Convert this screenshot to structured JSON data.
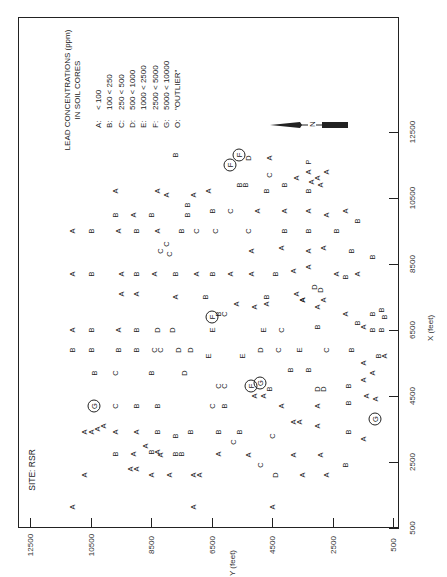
{
  "chart_data": {
    "type": "scatter",
    "site_label": "SITE: RSR",
    "xlabel": "X (feet)",
    "ylabel": "Y (feet)",
    "orientation": "page rotated 90° counter-clockwise",
    "xlim": [
      500,
      12500
    ],
    "ylim": [
      500,
      12500
    ],
    "x_ticks": [
      500,
      2500,
      4500,
      6500,
      8500,
      10500,
      12500
    ],
    "y_ticks": [
      500,
      2500,
      4500,
      6500,
      8500,
      10500,
      12500
    ],
    "grid": false,
    "legend": {
      "title_line1": "LEAD CONCENTRATIONS (ppm)",
      "title_line2": "IN SOIL CORES",
      "items": [
        {
          "code": "A:",
          "range": "< 100"
        },
        {
          "code": "B:",
          "range": "100 < 250"
        },
        {
          "code": "C:",
          "range": "250 < 500"
        },
        {
          "code": "D:",
          "range": "500 < 1000"
        },
        {
          "code": "E:",
          "range": "1000 < 2500"
        },
        {
          "code": "F:",
          "range": "2500 < 5000"
        },
        {
          "code": "G:",
          "range": "5000 < 10000"
        },
        {
          "code": "O:",
          "range": "\"OUTLIER\""
        }
      ]
    },
    "north_arrow_label": "N",
    "points": [
      {
        "x": 1150,
        "y": 11100,
        "c": "A"
      },
      {
        "x": 1150,
        "y": 7100,
        "c": "A"
      },
      {
        "x": 1150,
        "y": 4500,
        "c": "A"
      },
      {
        "x": 2100,
        "y": 10700,
        "c": "A"
      },
      {
        "x": 2100,
        "y": 8500,
        "c": "A"
      },
      {
        "x": 2100,
        "y": 7900,
        "c": "A"
      },
      {
        "x": 2100,
        "y": 7100,
        "c": "A"
      },
      {
        "x": 2100,
        "y": 6900,
        "c": "A"
      },
      {
        "x": 2100,
        "y": 4400,
        "c": "D"
      },
      {
        "x": 2100,
        "y": 3500,
        "c": "A"
      },
      {
        "x": 2100,
        "y": 2700,
        "c": "A"
      },
      {
        "x": 2300,
        "y": 9200,
        "c": "A"
      },
      {
        "x": 2300,
        "y": 9000,
        "c": "A"
      },
      {
        "x": 2400,
        "y": 4900,
        "c": "C"
      },
      {
        "x": 2400,
        "y": 2100,
        "c": "B"
      },
      {
        "x": 2750,
        "y": 9700,
        "c": "B"
      },
      {
        "x": 2750,
        "y": 9100,
        "c": "A"
      },
      {
        "x": 2700,
        "y": 8200,
        "c": "A"
      },
      {
        "x": 2800,
        "y": 8500,
        "c": "B"
      },
      {
        "x": 2800,
        "y": 8300,
        "c": "A"
      },
      {
        "x": 2750,
        "y": 7700,
        "c": "B"
      },
      {
        "x": 2750,
        "y": 7500,
        "c": "B"
      },
      {
        "x": 2750,
        "y": 6300,
        "c": "A"
      },
      {
        "x": 2700,
        "y": 5300,
        "c": "A"
      },
      {
        "x": 2700,
        "y": 3800,
        "c": "A"
      },
      {
        "x": 2700,
        "y": 2900,
        "c": "A"
      },
      {
        "x": 3000,
        "y": 8700,
        "c": "A"
      },
      {
        "x": 3100,
        "y": 5800,
        "c": "C"
      },
      {
        "x": 3300,
        "y": 4500,
        "c": "C"
      },
      {
        "x": 3400,
        "y": 10700,
        "c": "A"
      },
      {
        "x": 3400,
        "y": 10500,
        "c": "A"
      },
      {
        "x": 3500,
        "y": 10300,
        "c": "A"
      },
      {
        "x": 3600,
        "y": 10100,
        "c": "A"
      },
      {
        "x": 3400,
        "y": 9700,
        "c": "A"
      },
      {
        "x": 3400,
        "y": 9000,
        "c": "A"
      },
      {
        "x": 3400,
        "y": 8300,
        "c": "B"
      },
      {
        "x": 3300,
        "y": 7700,
        "c": "B"
      },
      {
        "x": 3400,
        "y": 7200,
        "c": "B"
      },
      {
        "x": 3400,
        "y": 6300,
        "c": "B"
      },
      {
        "x": 3400,
        "y": 5600,
        "c": "B"
      },
      {
        "x": 3700,
        "y": 3800,
        "c": "A"
      },
      {
        "x": 3700,
        "y": 3600,
        "c": "A"
      },
      {
        "x": 3600,
        "y": 3000,
        "c": "A"
      },
      {
        "x": 3400,
        "y": 2000,
        "c": "B"
      },
      {
        "x": 3200,
        "y": 1500,
        "c": "A"
      },
      {
        "x": 3800,
        "y": 1100,
        "c": "G",
        "circled": true
      },
      {
        "x": 4200,
        "y": 10400,
        "c": "G",
        "circled": true
      },
      {
        "x": 4200,
        "y": 9700,
        "c": "C"
      },
      {
        "x": 4200,
        "y": 9000,
        "c": "B"
      },
      {
        "x": 4200,
        "y": 8300,
        "c": "B"
      },
      {
        "x": 4200,
        "y": 6500,
        "c": "C"
      },
      {
        "x": 4200,
        "y": 6100,
        "c": "B"
      },
      {
        "x": 4200,
        "y": 4200,
        "c": "A"
      },
      {
        "x": 4200,
        "y": 3000,
        "c": "A"
      },
      {
        "x": 4300,
        "y": 2000,
        "c": "B"
      },
      {
        "x": 4500,
        "y": 5100,
        "c": "A"
      },
      {
        "x": 4500,
        "y": 4800,
        "c": "A"
      },
      {
        "x": 4700,
        "y": 4600,
        "c": "B"
      },
      {
        "x": 4800,
        "y": 6300,
        "c": "C"
      },
      {
        "x": 4800,
        "y": 6100,
        "c": "C"
      },
      {
        "x": 4800,
        "y": 5200,
        "c": "F",
        "circled": true
      },
      {
        "x": 4900,
        "y": 4900,
        "c": "G",
        "circled": true
      },
      {
        "x": 4700,
        "y": 3000,
        "c": "D"
      },
      {
        "x": 4700,
        "y": 2800,
        "c": "D"
      },
      {
        "x": 4800,
        "y": 2000,
        "c": "B"
      },
      {
        "x": 4500,
        "y": 1400,
        "c": "A"
      },
      {
        "x": 4400,
        "y": 1100,
        "c": "A"
      },
      {
        "x": 5200,
        "y": 10400,
        "c": "B"
      },
      {
        "x": 5200,
        "y": 9700,
        "c": "C"
      },
      {
        "x": 5200,
        "y": 8500,
        "c": "B"
      },
      {
        "x": 5200,
        "y": 7400,
        "c": "D"
      },
      {
        "x": 5300,
        "y": 3900,
        "c": "B"
      },
      {
        "x": 5300,
        "y": 3300,
        "c": "B"
      },
      {
        "x": 5000,
        "y": 1500,
        "c": "A"
      },
      {
        "x": 5200,
        "y": 1200,
        "c": "A"
      },
      {
        "x": 5900,
        "y": 11100,
        "c": "B"
      },
      {
        "x": 5900,
        "y": 10500,
        "c": "B"
      },
      {
        "x": 5900,
        "y": 9600,
        "c": "B"
      },
      {
        "x": 5900,
        "y": 9000,
        "c": "B"
      },
      {
        "x": 5900,
        "y": 8400,
        "c": "C"
      },
      {
        "x": 5900,
        "y": 8200,
        "c": "C"
      },
      {
        "x": 5900,
        "y": 7600,
        "c": "D"
      },
      {
        "x": 5900,
        "y": 7200,
        "c": "D"
      },
      {
        "x": 5700,
        "y": 6600,
        "c": "E"
      },
      {
        "x": 5700,
        "y": 5500,
        "c": "E"
      },
      {
        "x": 5900,
        "y": 4900,
        "c": "D"
      },
      {
        "x": 5900,
        "y": 4300,
        "c": "C"
      },
      {
        "x": 5900,
        "y": 3600,
        "c": "E"
      },
      {
        "x": 5900,
        "y": 2700,
        "c": "C"
      },
      {
        "x": 5900,
        "y": 1900,
        "c": "B"
      },
      {
        "x": 5500,
        "y": 1500,
        "c": "A"
      },
      {
        "x": 5700,
        "y": 1000,
        "c": "B"
      },
      {
        "x": 5700,
        "y": 800,
        "c": "A"
      },
      {
        "x": 6500,
        "y": 11100,
        "c": "A"
      },
      {
        "x": 6500,
        "y": 10500,
        "c": "B"
      },
      {
        "x": 6500,
        "y": 9600,
        "c": "A"
      },
      {
        "x": 6500,
        "y": 9000,
        "c": "B"
      },
      {
        "x": 6500,
        "y": 8300,
        "c": "D"
      },
      {
        "x": 6500,
        "y": 7800,
        "c": "D"
      },
      {
        "x": 6500,
        "y": 6500,
        "c": "E"
      },
      {
        "x": 6500,
        "y": 4800,
        "c": "E"
      },
      {
        "x": 6500,
        "y": 4200,
        "c": "C"
      },
      {
        "x": 6600,
        "y": 3000,
        "c": "B"
      },
      {
        "x": 6600,
        "y": 1500,
        "c": "A"
      },
      {
        "x": 6500,
        "y": 1200,
        "c": "B"
      },
      {
        "x": 6500,
        "y": 900,
        "c": "B"
      },
      {
        "x": 6900,
        "y": 6500,
        "c": "F",
        "circled": true
      },
      {
        "x": 7000,
        "y": 6300,
        "c": "B"
      },
      {
        "x": 7000,
        "y": 6100,
        "c": "C"
      },
      {
        "x": 7300,
        "y": 5700,
        "c": "A"
      },
      {
        "x": 7200,
        "y": 5100,
        "c": "A"
      },
      {
        "x": 7300,
        "y": 4700,
        "c": "A"
      },
      {
        "x": 7400,
        "y": 3500,
        "c": "A"
      },
      {
        "x": 7200,
        "y": 3000,
        "c": "A"
      },
      {
        "x": 7000,
        "y": 2100,
        "c": "A"
      },
      {
        "x": 6700,
        "y": 1700,
        "c": "B"
      },
      {
        "x": 6900,
        "y": 800,
        "c": "B"
      },
      {
        "x": 7000,
        "y": 1200,
        "c": "B"
      },
      {
        "x": 7100,
        "y": 900,
        "c": "B"
      },
      {
        "x": 7600,
        "y": 9500,
        "c": "A"
      },
      {
        "x": 7600,
        "y": 9000,
        "c": "A"
      },
      {
        "x": 7500,
        "y": 7700,
        "c": "A"
      },
      {
        "x": 7500,
        "y": 6700,
        "c": "B"
      },
      {
        "x": 7500,
        "y": 4700,
        "c": "B"
      },
      {
        "x": 7600,
        "y": 3700,
        "c": "A"
      },
      {
        "x": 7400,
        "y": 3500,
        "c": "A"
      },
      {
        "x": 7400,
        "y": 2800,
        "c": "A"
      },
      {
        "x": 7800,
        "y": 3100,
        "c": "D"
      },
      {
        "x": 7700,
        "y": 2900,
        "c": "D"
      },
      {
        "x": 8200,
        "y": 11100,
        "c": "A"
      },
      {
        "x": 8200,
        "y": 10500,
        "c": "B"
      },
      {
        "x": 8200,
        "y": 9500,
        "c": "A"
      },
      {
        "x": 8200,
        "y": 9000,
        "c": "B"
      },
      {
        "x": 8200,
        "y": 8400,
        "c": "A"
      },
      {
        "x": 8200,
        "y": 7700,
        "c": "B"
      },
      {
        "x": 8200,
        "y": 7000,
        "c": "A"
      },
      {
        "x": 8200,
        "y": 6500,
        "c": "B"
      },
      {
        "x": 8200,
        "y": 5900,
        "c": "A"
      },
      {
        "x": 8200,
        "y": 5200,
        "c": "A"
      },
      {
        "x": 8200,
        "y": 4400,
        "c": "B"
      },
      {
        "x": 8300,
        "y": 3800,
        "c": "A"
      },
      {
        "x": 8400,
        "y": 3300,
        "c": "A"
      },
      {
        "x": 8200,
        "y": 2400,
        "c": "A"
      },
      {
        "x": 8100,
        "y": 2100,
        "c": "B"
      },
      {
        "x": 8200,
        "y": 1700,
        "c": "A"
      },
      {
        "x": 8900,
        "y": 8200,
        "c": "C"
      },
      {
        "x": 9100,
        "y": 8000,
        "c": "C"
      },
      {
        "x": 8800,
        "y": 7900,
        "c": "C"
      },
      {
        "x": 8900,
        "y": 5200,
        "c": "A"
      },
      {
        "x": 9000,
        "y": 4200,
        "c": "A"
      },
      {
        "x": 8900,
        "y": 3300,
        "c": "A"
      },
      {
        "x": 9000,
        "y": 2800,
        "c": "A"
      },
      {
        "x": 8900,
        "y": 1900,
        "c": "B"
      },
      {
        "x": 8700,
        "y": 1200,
        "c": "B"
      },
      {
        "x": 9500,
        "y": 11100,
        "c": "A"
      },
      {
        "x": 9500,
        "y": 10500,
        "c": "B"
      },
      {
        "x": 9500,
        "y": 9600,
        "c": "A"
      },
      {
        "x": 9500,
        "y": 9000,
        "c": "B"
      },
      {
        "x": 9500,
        "y": 8300,
        "c": "A"
      },
      {
        "x": 9500,
        "y": 7500,
        "c": "B"
      },
      {
        "x": 9500,
        "y": 7000,
        "c": "C"
      },
      {
        "x": 9500,
        "y": 6400,
        "c": "C"
      },
      {
        "x": 9500,
        "y": 5300,
        "c": "C"
      },
      {
        "x": 9500,
        "y": 4100,
        "c": "B"
      },
      {
        "x": 9500,
        "y": 3300,
        "c": "B"
      },
      {
        "x": 9500,
        "y": 2400,
        "c": "B"
      },
      {
        "x": 10000,
        "y": 9700,
        "c": "B"
      },
      {
        "x": 10000,
        "y": 9100,
        "c": "A"
      },
      {
        "x": 10000,
        "y": 8500,
        "c": "B"
      },
      {
        "x": 10000,
        "y": 7300,
        "c": "B"
      },
      {
        "x": 10300,
        "y": 7300,
        "c": "B"
      },
      {
        "x": 10100,
        "y": 6500,
        "c": "B"
      },
      {
        "x": 10100,
        "y": 5900,
        "c": "C"
      },
      {
        "x": 10100,
        "y": 5000,
        "c": "A"
      },
      {
        "x": 10100,
        "y": 4100,
        "c": "A"
      },
      {
        "x": 10100,
        "y": 3300,
        "c": "A"
      },
      {
        "x": 10000,
        "y": 2700,
        "c": "A"
      },
      {
        "x": 10100,
        "y": 2100,
        "c": "A"
      },
      {
        "x": 9800,
        "y": 1700,
        "c": "B"
      },
      {
        "x": 10700,
        "y": 9700,
        "c": "A"
      },
      {
        "x": 10700,
        "y": 8300,
        "c": "A"
      },
      {
        "x": 10600,
        "y": 8000,
        "c": "A"
      },
      {
        "x": 10600,
        "y": 7100,
        "c": "A"
      },
      {
        "x": 10700,
        "y": 6600,
        "c": "A"
      },
      {
        "x": 10900,
        "y": 5600,
        "c": "B"
      },
      {
        "x": 10900,
        "y": 5400,
        "c": "B"
      },
      {
        "x": 10700,
        "y": 4700,
        "c": "B"
      },
      {
        "x": 10900,
        "y": 4100,
        "c": "B"
      },
      {
        "x": 10700,
        "y": 3300,
        "c": "B"
      },
      {
        "x": 11000,
        "y": 3200,
        "c": "A"
      },
      {
        "x": 10900,
        "y": 2900,
        "c": "A"
      },
      {
        "x": 11200,
        "y": 4600,
        "c": "C"
      },
      {
        "x": 11100,
        "y": 3700,
        "c": "A"
      },
      {
        "x": 11300,
        "y": 3300,
        "c": "A"
      },
      {
        "x": 11100,
        "y": 3000,
        "c": "A"
      },
      {
        "x": 11300,
        "y": 2700,
        "c": "A"
      },
      {
        "x": 11500,
        "y": 5900,
        "c": "F",
        "circled": true
      },
      {
        "x": 11800,
        "y": 5600,
        "c": "F",
        "circled": true
      },
      {
        "x": 11700,
        "y": 5300,
        "c": "D"
      },
      {
        "x": 11700,
        "y": 4600,
        "c": "A"
      },
      {
        "x": 11600,
        "y": 3300,
        "c": "P"
      },
      {
        "x": 11800,
        "y": 7700,
        "c": "B"
      }
    ]
  },
  "labels": {
    "site": "SITE: RSR",
    "xlabel": "X (feet)",
    "ylabel": "Y (feet)",
    "north": "N"
  }
}
